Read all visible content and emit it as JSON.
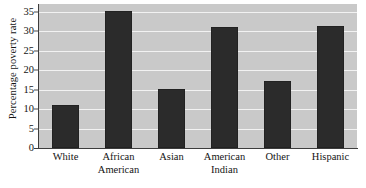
{
  "chart_data": {
    "type": "bar",
    "title": "",
    "xlabel": "",
    "ylabel": "Percentage poverty rate",
    "categories": [
      "White",
      "African American",
      "Asian",
      "American Indian",
      "Other",
      "Hispanic"
    ],
    "values": [
      11,
      35.2,
      15.1,
      31,
      17.1,
      31.3
    ],
    "ylim": [
      0,
      37
    ],
    "yticks": [
      0,
      5,
      10,
      15,
      20,
      25,
      30,
      35
    ],
    "ytick_labels": [
      "0",
      "5",
      "10",
      "15",
      "20",
      "25",
      "30",
      "35"
    ],
    "grid": true,
    "legend": false,
    "colors": {
      "bar": "#2b2b2b",
      "plot_background": "#c9c9c9",
      "gridline": "#f2f2f2",
      "axis": "#3d3d3d",
      "page_background": "#ffffff",
      "text": "#141414"
    }
  }
}
